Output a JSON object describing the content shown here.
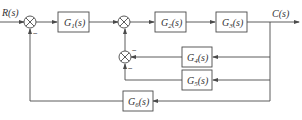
{
  "diagram": {
    "type": "control-system-block-diagram",
    "input_label": "R(s)",
    "output_label": "C(s)",
    "blocks": [
      {
        "id": "G1",
        "label": "G1(s)",
        "main": "G",
        "sub": "1",
        "tail": "(s)"
      },
      {
        "id": "G2",
        "label": "G2(s)",
        "main": "G",
        "sub": "2",
        "tail": "(s)"
      },
      {
        "id": "G3",
        "label": "G3(s)",
        "main": "G",
        "sub": "3",
        "tail": "(s)"
      },
      {
        "id": "G4",
        "label": "G4(s)",
        "main": "G",
        "sub": "4",
        "tail": "(s)"
      },
      {
        "id": "G5",
        "label": "G5(s)",
        "main": "G",
        "sub": "5",
        "tail": "(s)"
      },
      {
        "id": "G6",
        "label": "G6(s)",
        "main": "G",
        "sub": "6",
        "tail": "(s)"
      }
    ],
    "summing_junctions": [
      {
        "id": "S1",
        "signs": {
          "feedback": "−"
        }
      },
      {
        "id": "S2",
        "signs": {}
      },
      {
        "id": "S3",
        "signs": {
          "right": "−",
          "bottom": "−"
        }
      }
    ],
    "connections": [
      "R(s) -> S1",
      "S1 -> G1",
      "G1 -> S2",
      "S2 -> G2",
      "G2 -> G3",
      "G3 -> C(s)",
      "C(s) -> G4 -> S3 (−)",
      "C(s) -> G5 -> S3 (−)",
      "S3 -> S2",
      "C(s) -> G6 -> S1 (−)"
    ]
  }
}
